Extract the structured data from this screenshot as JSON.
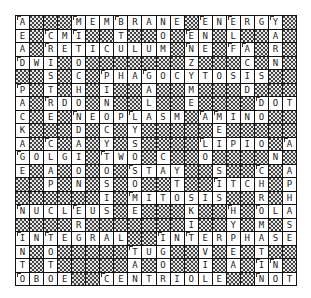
{
  "puzzle": {
    "type": "crossword",
    "rows": 20,
    "cols": 20,
    "block_char": "#",
    "grid": [
      "A###MEMBRANE#ENERGY#",
      "E#CMI##T##O#EN#L##A#",
      "A#RETICULUM#NE#FA#R#",
      "DWI#O#######Z###C#N#",
      "##S#C#PHAGOCYTOSIS##",
      "P#T#H#I##A##M###D###",
      "A#RDO#N##L##E####DOT",
      "C#E#NEOPLASM#AMINO##",
      "K###D#C#Y#####E#####",
      "A#C#A#Y#S####LIPIO#A",
      "GOLGI#TWO#C##O####N#",
      "E#A#O#O#STAY##S##C#A",
      "##P#N#S#O##T##ITCH#P",
      "######I#MITOSIS##R#H",
      "NUCLEUS#E###K##H#OLA",
      "####R#######I##Y#M#S",
      "INTEGRAL##INTERPHASE",
      "N#O#####TUG##V#E#T##",
      "T#T#####A#O##I#A#IN#",
      "OBOE##CENTRIOLE##NOT"
    ],
    "numbered_cells": [
      [
        0,
        0
      ],
      [
        0,
        4
      ],
      [
        0,
        7
      ],
      [
        0,
        13
      ],
      [
        0,
        15
      ],
      [
        0,
        18
      ],
      [
        1,
        2
      ],
      [
        1,
        4
      ],
      [
        1,
        12
      ],
      [
        2,
        2
      ],
      [
        2,
        12
      ],
      [
        2,
        15
      ],
      [
        2,
        16
      ],
      [
        3,
        0
      ],
      [
        4,
        6
      ],
      [
        4,
        9
      ],
      [
        5,
        0
      ],
      [
        6,
        2
      ],
      [
        6,
        17
      ],
      [
        7,
        4
      ],
      [
        7,
        8
      ],
      [
        7,
        13
      ],
      [
        7,
        14
      ],
      [
        9,
        2
      ],
      [
        9,
        13
      ],
      [
        9,
        19
      ],
      [
        10,
        0
      ],
      [
        10,
        6
      ],
      [
        10,
        11
      ],
      [
        11,
        8
      ],
      [
        11,
        17
      ],
      [
        12,
        14
      ],
      [
        13,
        8
      ],
      [
        14,
        0
      ],
      [
        14,
        4
      ],
      [
        14,
        15
      ],
      [
        14,
        17
      ],
      [
        16,
        0
      ],
      [
        16,
        2
      ],
      [
        16,
        10
      ],
      [
        16,
        12
      ],
      [
        17,
        8
      ],
      [
        18,
        17
      ],
      [
        18,
        18
      ],
      [
        19,
        0
      ],
      [
        19,
        6
      ],
      [
        19,
        17
      ]
    ],
    "colors": {
      "grid_line": "#111111",
      "cell_background": "#ffffff",
      "block_pattern_dark": "#444444",
      "block_pattern_light": "#e6e6e6",
      "letter": "#222222"
    }
  }
}
